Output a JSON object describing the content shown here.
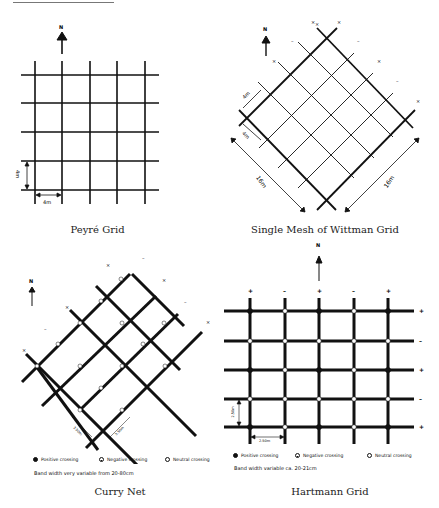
{
  "figure": {
    "panels": [
      {
        "id": "peyre",
        "caption": "Peyré Grid",
        "north_label": "N",
        "dim_vertical": "4m",
        "dim_horizontal": "4m"
      },
      {
        "id": "wittman",
        "caption": "Single Mesh of Wittman Grid",
        "north_label": "N",
        "dim_mesh_1": "4m",
        "dim_mesh_2": "4m",
        "dim_side_left": "16m",
        "dim_side_right": "16m",
        "line_markers": [
          "×",
          "×",
          "–",
          "×",
          "–",
          "×",
          "–",
          "×"
        ]
      },
      {
        "id": "curry",
        "caption": "Curry Net",
        "north_label": "N",
        "dim_left": "3.50m",
        "dim_right": "3.50m",
        "line_markers": [
          "×",
          "–",
          "×",
          "–",
          "×",
          "×",
          "–",
          "×"
        ],
        "legend": {
          "positive": "Positive crossing",
          "negative": "Negative crossing",
          "neutral": "Neutral crossing"
        },
        "band_note": "Band width very variable from 20-80cm"
      },
      {
        "id": "hartmann",
        "caption": "Hartmann Grid",
        "north_label": "N",
        "dim_vertical": "2.50m",
        "dim_horizontal": "2.50m",
        "column_signs": [
          "+",
          "–",
          "+",
          "–",
          "+"
        ],
        "row_signs": [
          "+",
          "–",
          "+",
          "–",
          "+"
        ],
        "legend": {
          "positive": "Positive crossing",
          "negative": "Negative crossing",
          "neutral": "Neutral crossing"
        },
        "band_note": "Band width variable ca. 20-21cm"
      }
    ]
  }
}
